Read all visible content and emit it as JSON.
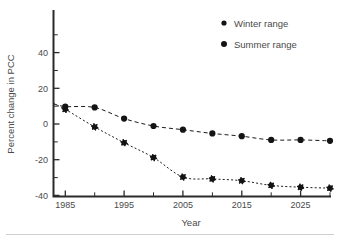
{
  "chart_data": {
    "type": "line",
    "title": "",
    "xlabel": "Year",
    "ylabel": "Percent change in PCC",
    "xlim": [
      1983,
      2030
    ],
    "ylim": [
      -50,
      50
    ],
    "grid": false,
    "legend_position": "top-right",
    "x_ticks_major": [
      1985,
      1995,
      2005,
      2015,
      2025
    ],
    "x_ticks_major_labels": [
      "1985",
      "1995",
      "2005",
      "2015",
      "2025"
    ],
    "x_ticks_minor": [
      1990,
      2000,
      2010,
      2020,
      2030
    ],
    "y_ticks_major": [
      40,
      20,
      0,
      -20,
      -40
    ],
    "y_ticks_major_labels": [
      "40",
      "20",
      "0",
      "-20",
      "-40"
    ],
    "y_ticks_minor": [
      50,
      30,
      10,
      -10,
      -30,
      -50
    ],
    "x": [
      1983,
      1985,
      1990,
      1995,
      2000,
      2005,
      2010,
      2015,
      2020,
      2025,
      2030
    ],
    "series": [
      {
        "name": "Winter range",
        "marker": "star",
        "linestyle": "dotted",
        "color": "#141414",
        "values": [
          0,
          -3,
          -12.5,
          -21,
          -29,
          -39.5,
          -40.5,
          -41.5,
          -44,
          -45,
          -45.5
        ]
      },
      {
        "name": "Summer range",
        "marker": "circle",
        "linestyle": "dashed",
        "color": "#141414",
        "values": [
          0,
          -1.5,
          -2,
          -8,
          -12,
          -14,
          -16,
          -17.5,
          -19.5,
          -19.5,
          -20
        ]
      }
    ]
  },
  "legend": {
    "entries": [
      {
        "label": "Winter range",
        "marker_name": "winter-range-marker"
      },
      {
        "label": "Summer range",
        "marker_name": "summer-range-marker"
      }
    ]
  },
  "axes": {
    "x_axis_title": "Year",
    "y_axis_title": "Percent change in PCC"
  }
}
